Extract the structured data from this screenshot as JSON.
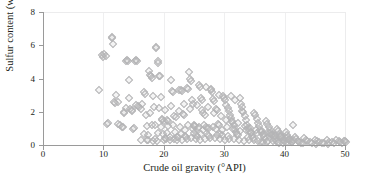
{
  "chart_data": {
    "type": "scatter",
    "title": "",
    "xlabel": "Crude oil gravity (°API)",
    "ylabel": "Sulfur content (wt.%)",
    "xlim": [
      0,
      50
    ],
    "ylim": [
      0,
      8
    ],
    "xticks": [
      0,
      10,
      20,
      30,
      40,
      50
    ],
    "yticks": [
      0,
      2,
      4,
      6,
      8
    ],
    "xtick_labels": [
      "0",
      "10",
      "20",
      "30",
      "40",
      "50"
    ],
    "ytick_labels": [
      "0",
      "2",
      "4",
      "6",
      "8"
    ],
    "grid": {
      "vertical": true,
      "horizontal": false
    },
    "legend": null,
    "marker": {
      "shape": "diamond",
      "filled": false,
      "color": "#b4b4b6",
      "size": 4
    },
    "series": [
      {
        "name": "Crude oil samples",
        "points": [
          [
            9.1,
            3.4
          ],
          [
            9.6,
            5.55
          ],
          [
            9.7,
            5.42
          ],
          [
            10.0,
            5.62
          ],
          [
            10.2,
            5.48
          ],
          [
            10.4,
            1.4
          ],
          [
            10.6,
            1.42
          ],
          [
            11.2,
            6.62
          ],
          [
            11.3,
            6.58
          ],
          [
            11.5,
            6.2
          ],
          [
            11.6,
            2.7
          ],
          [
            11.8,
            2.62
          ],
          [
            12.0,
            3.1
          ],
          [
            12.3,
            1.38
          ],
          [
            12.6,
            1.3
          ],
          [
            12.9,
            1.18
          ],
          [
            13.0,
            1.22
          ],
          [
            13.2,
            2.05
          ],
          [
            13.3,
            2.1
          ],
          [
            13.5,
            5.2
          ],
          [
            13.7,
            5.22
          ],
          [
            13.9,
            5.15
          ],
          [
            14.0,
            4.05
          ],
          [
            14.1,
            2.95
          ],
          [
            14.3,
            2.3
          ],
          [
            14.5,
            2.25
          ],
          [
            14.7,
            1.1
          ],
          [
            14.9,
            1.15
          ],
          [
            15.0,
            5.18
          ],
          [
            15.2,
            5.25
          ],
          [
            15.4,
            5.2
          ],
          [
            15.6,
            2.45
          ],
          [
            15.8,
            2.4
          ],
          [
            16.0,
            0.42
          ],
          [
            16.3,
            2.6
          ],
          [
            16.5,
            3.3
          ],
          [
            16.7,
            3.2
          ],
          [
            17.0,
            0.45
          ],
          [
            17.2,
            0.4
          ],
          [
            17.4,
            4.55
          ],
          [
            17.5,
            4.35
          ],
          [
            17.7,
            4.3
          ],
          [
            17.9,
            4.15
          ],
          [
            18.0,
            3.05
          ],
          [
            18.2,
            2.4
          ],
          [
            18.4,
            0.5
          ],
          [
            18.5,
            6.0
          ],
          [
            18.6,
            5.95
          ],
          [
            18.8,
            5.05
          ],
          [
            18.9,
            5.15
          ],
          [
            19.0,
            4.3
          ],
          [
            19.2,
            4.25
          ],
          [
            19.3,
            3.0
          ],
          [
            19.5,
            1.7
          ],
          [
            19.6,
            1.65
          ],
          [
            19.8,
            1.55
          ],
          [
            20.0,
            0.55
          ],
          [
            20.2,
            0.5
          ],
          [
            20.4,
            1.6
          ],
          [
            20.6,
            1.55
          ],
          [
            20.8,
            0.6
          ],
          [
            21.0,
            4.05
          ],
          [
            21.2,
            3.35
          ],
          [
            21.4,
            3.3
          ],
          [
            21.6,
            1.85
          ],
          [
            21.8,
            1.8
          ],
          [
            22.0,
            0.62
          ],
          [
            22.2,
            0.58
          ],
          [
            22.4,
            3.45
          ],
          [
            22.6,
            3.4
          ],
          [
            22.8,
            3.35
          ],
          [
            23.0,
            2.0
          ],
          [
            23.2,
            1.95
          ],
          [
            23.4,
            0.65
          ],
          [
            23.5,
            0.6
          ],
          [
            23.7,
            3.55
          ],
          [
            23.9,
            3.5
          ],
          [
            24.0,
            4.5
          ],
          [
            24.2,
            4.1
          ],
          [
            24.4,
            3.95
          ],
          [
            24.5,
            2.8
          ],
          [
            24.7,
            2.6
          ],
          [
            24.9,
            1.3
          ],
          [
            25.0,
            1.25
          ],
          [
            25.2,
            0.7
          ],
          [
            25.4,
            0.65
          ],
          [
            25.6,
            3.7
          ],
          [
            25.8,
            3.6
          ],
          [
            26.0,
            2.95
          ],
          [
            26.2,
            2.85
          ],
          [
            26.4,
            2.05
          ],
          [
            26.6,
            1.9
          ],
          [
            26.8,
            1.2
          ],
          [
            27.0,
            1.15
          ],
          [
            27.2,
            0.72
          ],
          [
            27.4,
            0.68
          ],
          [
            27.6,
            3.4
          ],
          [
            27.8,
            3.3
          ],
          [
            28.0,
            2.9
          ],
          [
            28.2,
            2.75
          ],
          [
            28.4,
            2.3
          ],
          [
            28.6,
            2.2
          ],
          [
            28.8,
            1.4
          ],
          [
            29.0,
            1.35
          ],
          [
            29.2,
            0.8
          ],
          [
            29.4,
            0.75
          ],
          [
            29.6,
            3.05
          ],
          [
            29.8,
            2.95
          ],
          [
            30.0,
            2.8
          ],
          [
            30.2,
            2.55
          ],
          [
            30.4,
            2.35
          ],
          [
            30.6,
            2.15
          ],
          [
            30.8,
            1.95
          ],
          [
            31.0,
            1.75
          ],
          [
            31.2,
            1.5
          ],
          [
            31.4,
            1.3
          ],
          [
            31.6,
            1.1
          ],
          [
            31.8,
            0.9
          ],
          [
            32.0,
            0.78
          ],
          [
            32.2,
            0.7
          ],
          [
            32.4,
            2.95
          ],
          [
            32.6,
            2.6
          ],
          [
            32.8,
            2.4
          ],
          [
            33.0,
            2.1
          ],
          [
            33.2,
            1.85
          ],
          [
            33.4,
            1.6
          ],
          [
            33.6,
            1.35
          ],
          [
            33.8,
            1.15
          ],
          [
            34.0,
            0.95
          ],
          [
            34.2,
            0.82
          ],
          [
            34.4,
            0.68
          ],
          [
            34.6,
            0.55
          ],
          [
            34.8,
            2.05
          ],
          [
            35.0,
            1.9
          ],
          [
            35.2,
            1.7
          ],
          [
            35.4,
            1.45
          ],
          [
            35.6,
            1.25
          ],
          [
            35.8,
            1.05
          ],
          [
            36.0,
            0.88
          ],
          [
            36.2,
            0.72
          ],
          [
            36.4,
            0.6
          ],
          [
            36.6,
            0.48
          ],
          [
            36.8,
            1.55
          ],
          [
            37.0,
            1.4
          ],
          [
            37.2,
            1.2
          ],
          [
            37.4,
            1.0
          ],
          [
            37.6,
            0.85
          ],
          [
            37.8,
            0.7
          ],
          [
            38.0,
            0.58
          ],
          [
            38.2,
            0.46
          ],
          [
            38.4,
            0.38
          ],
          [
            38.6,
            1.1
          ],
          [
            38.8,
            0.95
          ],
          [
            39.0,
            0.8
          ],
          [
            39.2,
            0.65
          ],
          [
            39.4,
            0.52
          ],
          [
            39.6,
            0.42
          ],
          [
            39.8,
            0.35
          ],
          [
            40.0,
            0.88
          ],
          [
            40.2,
            0.72
          ],
          [
            40.4,
            0.58
          ],
          [
            40.6,
            0.45
          ],
          [
            40.8,
            0.36
          ],
          [
            41.0,
            0.3
          ],
          [
            41.2,
            1.3
          ],
          [
            41.5,
            0.62
          ],
          [
            41.8,
            0.48
          ],
          [
            42.0,
            0.38
          ],
          [
            42.3,
            0.3
          ],
          [
            42.6,
            0.26
          ],
          [
            43.0,
            0.55
          ],
          [
            43.3,
            0.42
          ],
          [
            43.6,
            0.34
          ],
          [
            44.0,
            0.28
          ],
          [
            44.4,
            0.24
          ],
          [
            44.8,
            0.45
          ],
          [
            45.2,
            0.36
          ],
          [
            45.6,
            0.3
          ],
          [
            46.0,
            0.26
          ],
          [
            46.4,
            0.22
          ],
          [
            46.8,
            0.4
          ],
          [
            47.2,
            0.33
          ],
          [
            47.6,
            0.28
          ],
          [
            48.0,
            0.24
          ],
          [
            48.4,
            0.42
          ],
          [
            48.8,
            0.35
          ],
          [
            49.0,
            0.3
          ],
          [
            49.3,
            0.26
          ],
          [
            49.6,
            0.38
          ],
          [
            49.8,
            0.34
          ],
          [
            50.0,
            0.3
          ],
          [
            18.1,
            0.35
          ],
          [
            18.7,
            0.38
          ],
          [
            19.9,
            0.42
          ],
          [
            20.9,
            0.45
          ],
          [
            21.5,
            0.48
          ],
          [
            22.1,
            0.44
          ],
          [
            22.9,
            0.4
          ],
          [
            23.6,
            0.46
          ],
          [
            24.3,
            0.52
          ],
          [
            25.1,
            0.48
          ],
          [
            25.9,
            0.44
          ],
          [
            26.7,
            0.5
          ],
          [
            27.5,
            0.56
          ],
          [
            28.3,
            0.52
          ],
          [
            29.1,
            0.48
          ],
          [
            29.9,
            0.44
          ],
          [
            30.7,
            0.5
          ],
          [
            31.5,
            0.46
          ],
          [
            32.3,
            0.42
          ],
          [
            33.1,
            0.38
          ],
          [
            33.9,
            0.44
          ],
          [
            34.7,
            0.4
          ],
          [
            35.5,
            0.36
          ],
          [
            36.3,
            0.32
          ],
          [
            37.1,
            0.38
          ],
          [
            37.9,
            0.34
          ],
          [
            38.7,
            0.3
          ],
          [
            39.5,
            0.26
          ],
          [
            40.3,
            0.32
          ],
          [
            41.1,
            0.28
          ],
          [
            12.2,
            2.68
          ],
          [
            13.6,
            2.35
          ],
          [
            14.6,
            2.15
          ],
          [
            15.3,
            2.52
          ],
          [
            16.1,
            2.28
          ],
          [
            16.9,
            1.95
          ],
          [
            17.6,
            2.05
          ],
          [
            19.1,
            2.35
          ],
          [
            20.1,
            2.2
          ],
          [
            21.1,
            2.45
          ],
          [
            22.3,
            2.15
          ],
          [
            23.1,
            2.6
          ],
          [
            24.1,
            2.3
          ],
          [
            25.3,
            2.5
          ],
          [
            26.1,
            2.25
          ],
          [
            27.1,
            2.4
          ],
          [
            28.1,
            2.05
          ],
          [
            29.3,
            1.85
          ],
          [
            30.1,
            1.65
          ],
          [
            31.1,
            1.55
          ],
          [
            32.1,
            1.45
          ],
          [
            33.3,
            1.25
          ],
          [
            34.1,
            1.15
          ],
          [
            35.1,
            1.05
          ],
          [
            36.1,
            0.95
          ],
          [
            37.3,
            0.85
          ],
          [
            38.1,
            0.75
          ],
          [
            39.1,
            0.65
          ],
          [
            40.1,
            0.55
          ],
          [
            41.3,
            0.45
          ],
          [
            23.3,
            1.05
          ],
          [
            24.6,
            1.1
          ],
          [
            25.5,
            1.15
          ],
          [
            26.3,
            1.05
          ],
          [
            27.3,
            1.12
          ],
          [
            28.5,
            1.08
          ],
          [
            29.5,
            1.02
          ],
          [
            30.3,
            1.18
          ],
          [
            31.3,
            1.08
          ],
          [
            32.5,
            0.98
          ],
          [
            33.5,
            1.05
          ],
          [
            34.3,
            0.92
          ],
          [
            35.3,
            0.85
          ],
          [
            36.5,
            0.78
          ],
          [
            37.5,
            0.72
          ],
          [
            38.3,
            0.66
          ],
          [
            39.3,
            0.58
          ],
          [
            40.5,
            0.5
          ],
          [
            30.9,
            3.05
          ],
          [
            31.7,
            2.85
          ],
          [
            32.7,
            2.15
          ],
          [
            28.9,
            3.15
          ],
          [
            27.7,
            3.5
          ],
          [
            26.9,
            3.6
          ],
          [
            35.9,
            0.3
          ],
          [
            36.9,
            0.28
          ],
          [
            38.9,
            0.24
          ],
          [
            42.8,
            0.22
          ],
          [
            45.0,
            0.2
          ],
          [
            47.0,
            0.18
          ],
          [
            17.1,
            1.25
          ],
          [
            17.8,
            1.3
          ],
          [
            18.3,
            1.35
          ],
          [
            19.4,
            1.2
          ],
          [
            20.5,
            1.28
          ],
          [
            21.3,
            1.35
          ],
          [
            22.5,
            1.22
          ],
          [
            23.8,
            1.32
          ],
          [
            24.8,
            1.25
          ],
          [
            25.7,
            1.18
          ],
          [
            26.5,
            1.3
          ],
          [
            27.9,
            1.22
          ],
          [
            16.6,
            0.8
          ],
          [
            17.3,
            0.75
          ],
          [
            18.9,
            0.85
          ],
          [
            19.7,
            0.78
          ],
          [
            20.3,
            0.82
          ],
          [
            21.7,
            0.88
          ],
          [
            22.7,
            0.76
          ],
          [
            24.9,
            0.84
          ],
          [
            26.0,
            0.8
          ],
          [
            28.7,
            0.72
          ],
          [
            30.5,
            0.68
          ],
          [
            33.7,
            0.62
          ]
        ]
      }
    ]
  }
}
